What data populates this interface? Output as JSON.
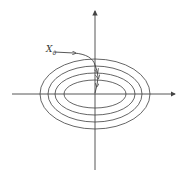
{
  "diagram": {
    "type": "contour-plot-with-trajectory",
    "axes": {
      "origin": [
        95,
        94
      ],
      "x_axis": {
        "from": [
          12,
          94
        ],
        "to": [
          176,
          94
        ],
        "arrow": true
      },
      "y_axis": {
        "from": [
          95,
          170
        ],
        "to": [
          95,
          10
        ],
        "arrow": true
      }
    },
    "contours": [
      {
        "rx": 55,
        "ry": 35
      },
      {
        "rx": 47,
        "ry": 28
      },
      {
        "rx": 40,
        "ry": 21
      },
      {
        "rx": 31,
        "ry": 14
      }
    ],
    "trajectory": {
      "start_label": "X",
      "start_label_sub": "0",
      "description": "path from X0 heading right then descending through contours toward the origin"
    },
    "colors": {
      "stroke": "#555555",
      "background": "#ffffff"
    }
  }
}
